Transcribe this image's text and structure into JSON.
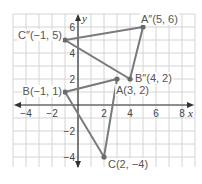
{
  "diagram": {
    "type": "coordinate-plane",
    "axes": {
      "x_label": "x",
      "y_label": "y",
      "x_range": [
        -5,
        9
      ],
      "y_range": [
        -5,
        7
      ],
      "x_ticks": [
        {
          "value": -4,
          "label": "−4"
        },
        {
          "value": -2,
          "label": "−2"
        },
        {
          "value": 2,
          "label": "2"
        },
        {
          "value": 4,
          "label": "4"
        },
        {
          "value": 6,
          "label": "6"
        },
        {
          "value": 8,
          "label": "8"
        }
      ],
      "y_ticks": [
        {
          "value": 6,
          "label": "6"
        },
        {
          "value": 4,
          "label": "4"
        },
        {
          "value": 2,
          "label": "2"
        },
        {
          "value": -2,
          "label": "−2"
        },
        {
          "value": -4,
          "label": "−4"
        }
      ]
    },
    "points": [
      {
        "id": "A",
        "label": "A(3, 2)",
        "x": 3,
        "y": 2
      },
      {
        "id": "B",
        "label": "B(−1, 1)",
        "x": -1,
        "y": 1
      },
      {
        "id": "C",
        "label": "C(2, −4)",
        "x": 2,
        "y": -4
      },
      {
        "id": "A2",
        "label": "A″(5, 6)",
        "x": 5,
        "y": 6
      },
      {
        "id": "B2",
        "label": "B″(4, 2)",
        "x": 4,
        "y": 2
      },
      {
        "id": "C2",
        "label": "C″(−1, 5)",
        "x": -1,
        "y": 5
      }
    ],
    "triangles": [
      {
        "name": "ABC",
        "vertices": [
          "A",
          "B",
          "C"
        ]
      },
      {
        "name": "A″B″C″",
        "vertices": [
          "A2",
          "B2",
          "C2"
        ]
      }
    ],
    "colors": {
      "grid": "#d4d4d4",
      "axis": "#333333",
      "segment": "#7a7a7a",
      "point": "#6a6a6a",
      "label": "#555555"
    }
  }
}
